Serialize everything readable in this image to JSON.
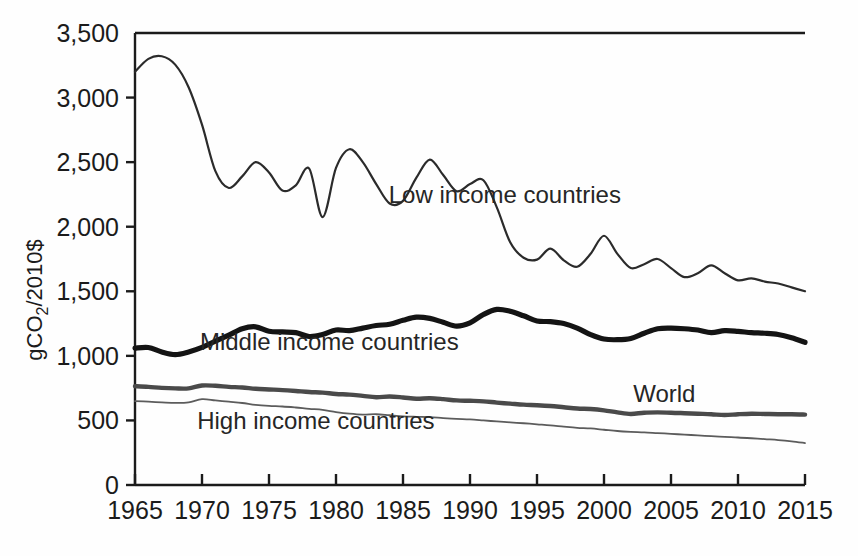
{
  "chart_data": {
    "type": "line",
    "title": "",
    "subtitle": "",
    "xlabel": "",
    "ylabel": "gCO2/2010$",
    "ylabel_rich": {
      "pre": "gCO",
      "sub": "2",
      "post": "/2010$"
    },
    "xlim": [
      1965,
      2015
    ],
    "ylim": [
      0,
      3500
    ],
    "ytick_labels": [
      "0",
      "500",
      "1,000",
      "1,500",
      "2,000",
      "2,500",
      "3,000",
      "3,500"
    ],
    "ytick_values": [
      0,
      500,
      1000,
      1500,
      2000,
      2500,
      3000,
      3500
    ],
    "xtick_labels": [
      "1965",
      "1970",
      "1975",
      "1980",
      "1985",
      "1990",
      "1995",
      "2000",
      "2005",
      "2010",
      "2015"
    ],
    "xtick_values": [
      1965,
      1970,
      1975,
      1980,
      1985,
      1990,
      1995,
      2000,
      2005,
      2010,
      2015
    ],
    "grid": false,
    "legend_position": "inline-annotations",
    "x": [
      1965,
      1966,
      1967,
      1968,
      1969,
      1970,
      1971,
      1972,
      1973,
      1974,
      1975,
      1976,
      1977,
      1978,
      1979,
      1980,
      1981,
      1982,
      1983,
      1984,
      1985,
      1986,
      1987,
      1988,
      1989,
      1990,
      1991,
      1992,
      1993,
      1994,
      1995,
      1996,
      1997,
      1998,
      1999,
      2000,
      2001,
      2002,
      2003,
      2004,
      2005,
      2006,
      2007,
      2008,
      2009,
      2010,
      2011,
      2012,
      2013,
      2014,
      2015
    ],
    "series": [
      {
        "name": "Low income countries",
        "color": "#2b2b2b",
        "stroke_width": 2.2,
        "label_x": 1992.6,
        "label_y": 2180,
        "values": [
          3200,
          3300,
          3320,
          3255,
          3080,
          2790,
          2430,
          2300,
          2390,
          2500,
          2420,
          2280,
          2320,
          2450,
          2075,
          2455,
          2600,
          2500,
          2330,
          2180,
          2200,
          2380,
          2520,
          2400,
          2275,
          2330,
          2360,
          2150,
          1880,
          1760,
          1745,
          1830,
          1740,
          1690,
          1790,
          1930,
          1790,
          1680,
          1710,
          1750,
          1680,
          1610,
          1640,
          1700,
          1640,
          1585,
          1600,
          1575,
          1560,
          1530,
          1500
        ]
      },
      {
        "name": "Middle income countries",
        "color": "#141414",
        "stroke_width": 5.2,
        "label_x": 1979.5,
        "label_y": 1045,
        "values": [
          1060,
          1065,
          1030,
          1010,
          1030,
          1065,
          1115,
          1160,
          1210,
          1225,
          1190,
          1185,
          1180,
          1150,
          1165,
          1200,
          1195,
          1215,
          1235,
          1245,
          1275,
          1300,
          1290,
          1260,
          1230,
          1255,
          1320,
          1360,
          1345,
          1310,
          1270,
          1265,
          1250,
          1215,
          1165,
          1130,
          1125,
          1135,
          1175,
          1210,
          1215,
          1210,
          1200,
          1180,
          1195,
          1190,
          1180,
          1175,
          1165,
          1140,
          1105
        ]
      },
      {
        "name": "World",
        "color": "#4a4a4a",
        "stroke_width": 4.4,
        "label_x": 2004.5,
        "label_y": 640,
        "values": [
          765,
          760,
          752,
          748,
          748,
          770,
          768,
          760,
          755,
          745,
          740,
          735,
          728,
          720,
          715,
          705,
          700,
          690,
          680,
          685,
          678,
          668,
          672,
          665,
          655,
          652,
          648,
          638,
          630,
          622,
          618,
          612,
          602,
          592,
          588,
          578,
          562,
          550,
          560,
          562,
          560,
          556,
          552,
          548,
          542,
          548,
          552,
          550,
          548,
          548,
          545
        ]
      },
      {
        "name": "High income countries",
        "color": "#5c5c5c",
        "stroke_width": 1.8,
        "label_x": 1978.5,
        "label_y": 430,
        "values": [
          650,
          645,
          640,
          636,
          640,
          665,
          655,
          645,
          635,
          620,
          612,
          608,
          600,
          590,
          582,
          565,
          552,
          545,
          548,
          540,
          532,
          528,
          525,
          518,
          512,
          508,
          500,
          492,
          485,
          478,
          470,
          462,
          452,
          443,
          438,
          428,
          418,
          412,
          408,
          402,
          396,
          390,
          384,
          378,
          372,
          368,
          362,
          355,
          348,
          338,
          325
        ]
      }
    ]
  },
  "axes": {
    "plot_left_px": 135,
    "plot_right_px": 805,
    "plot_top_px": 33,
    "plot_bottom_px": 485
  }
}
